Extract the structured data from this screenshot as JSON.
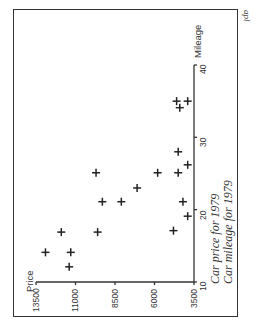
{
  "chart_data": {
    "type": "scatter",
    "orientation": "rotated 90deg counter-clockwise (price axis runs horizontally at bottom, mileage axis vertically at right)",
    "title": "",
    "captions": [
      "Car price for 1979",
      "Car mileage for 1979"
    ],
    "xlabel": "Mileage",
    "ylabel": "Price",
    "xlim": [
      10,
      40
    ],
    "ylim": [
      3500,
      13500
    ],
    "x_ticks": [
      "10",
      "20",
      "30",
      "40"
    ],
    "y_ticks": [
      "13500",
      "11000",
      "8500",
      "6000",
      "3500"
    ],
    "grid": false,
    "marker": "+",
    "points": [
      {
        "mileage": 35.0,
        "price": 4600
      },
      {
        "mileage": 35.0,
        "price": 3900
      },
      {
        "mileage": 34.1,
        "price": 4400
      },
      {
        "mileage": 28.0,
        "price": 4500
      },
      {
        "mileage": 26.2,
        "price": 3900
      },
      {
        "mileage": 25.1,
        "price": 9700
      },
      {
        "mileage": 25.1,
        "price": 5800
      },
      {
        "mileage": 25.1,
        "price": 4500
      },
      {
        "mileage": 23.0,
        "price": 7100
      },
      {
        "mileage": 21.1,
        "price": 9300
      },
      {
        "mileage": 21.1,
        "price": 8100
      },
      {
        "mileage": 21.1,
        "price": 4200
      },
      {
        "mileage": 19.1,
        "price": 3900
      },
      {
        "mileage": 16.9,
        "price": 11900
      },
      {
        "mileage": 16.9,
        "price": 9600
      },
      {
        "mileage": 17.1,
        "price": 4800
      },
      {
        "mileage": 14.1,
        "price": 12900
      },
      {
        "mileage": 14.1,
        "price": 11300
      },
      {
        "mileage": 12.1,
        "price": 11400
      }
    ]
  },
  "labels": {
    "price_axis": "Price",
    "mileage_axis": "Mileage",
    "caption_1": "Car price for 1979",
    "caption_2": "Car mileage for 1979",
    "corner_mark": "apl",
    "price_ticks": [
      "13500",
      "11000",
      "8500",
      "6000",
      "3500"
    ],
    "mileage_ticks": [
      "10",
      "20",
      "30",
      "40"
    ]
  }
}
